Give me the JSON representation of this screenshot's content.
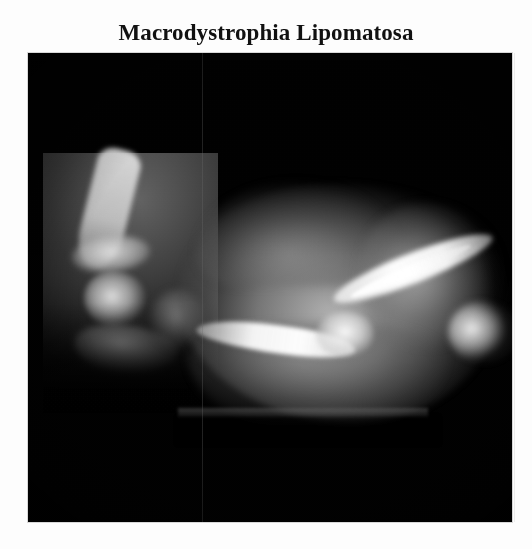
{
  "figure": {
    "title": "Macrodystrophia Lipomatosa",
    "modality": "radiograph",
    "view": "lateral foot and ankle",
    "background_color": "#fdfdfd",
    "film_color": "#010101",
    "title_color": "#111111"
  },
  "radiograph": {
    "caption": "Macrodystrophia Lipomatosa",
    "panels": [
      {
        "name": "left-panel",
        "label": "distal tibia and hindfoot",
        "structures": [
          "tibia-shaft",
          "tibia-metaphysis",
          "talus-body",
          "calcaneus",
          "navicular"
        ]
      },
      {
        "name": "right-panel",
        "label": "enlarged forefoot with fatty soft-tissue overgrowth",
        "structures": [
          "softtissue-mass",
          "softtissue-upper-hump",
          "softtissue-right-lobe",
          "softtissue-plantar",
          "bone-proximal-ray",
          "bone-distal-ray",
          "bone-apex-joint",
          "bone-far-tip"
        ]
      }
    ],
    "artifacts": [
      "splice-seam",
      "cassette-edge",
      "film-grain",
      "film-vignette"
    ]
  }
}
